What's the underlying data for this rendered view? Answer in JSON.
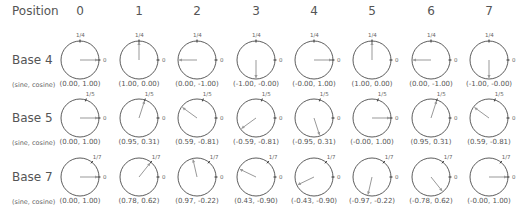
{
  "header": {
    "position_label": "Position",
    "positions": [
      "0",
      "1",
      "2",
      "3",
      "4",
      "5",
      "6",
      "7"
    ]
  },
  "rows": [
    {
      "label": "Base 4",
      "base": 4,
      "tick_label": "1/4",
      "zero_label": "0",
      "coord_caption": "(sine, cosine)",
      "coords": [
        "(0.00, 1.00)",
        "(1.00, 0.00)",
        "(0.00, -1.00)",
        "(-1.00, -0.00)",
        "(-0.00, 1.00)",
        "(1.00, 0.00)",
        "(0.00, -1.00)",
        "(-1.00, -0.00)"
      ]
    },
    {
      "label": "Base 5",
      "base": 5,
      "tick_label": "1/5",
      "zero_label": "0",
      "coord_caption": "(sine, cosine)",
      "coords": [
        "(0.00, 1.00)",
        "(0.95, 0.31)",
        "(0.59, -0.81)",
        "(-0.59, -0.81)",
        "(-0.95, 0.31)",
        "(-0.00, 1.00)",
        "(0.95, 0.31)",
        "(0.59, -0.81)"
      ]
    },
    {
      "label": "Base 7",
      "base": 7,
      "tick_label": "1/7",
      "zero_label": "0",
      "coord_caption": "(sine, cosine)",
      "coords": [
        "(0.00, 1.00)",
        "(0.78, 0.62)",
        "(0.97, -0.22)",
        "(0.43, -0.90)",
        "(-0.43, -0.90)",
        "(-0.97, -0.22)",
        "(-0.78, 0.62)",
        "(-0.00, 1.00)"
      ]
    }
  ],
  "colors": {
    "circle": "#333333",
    "arrow": "#999999",
    "text": "#555555"
  }
}
